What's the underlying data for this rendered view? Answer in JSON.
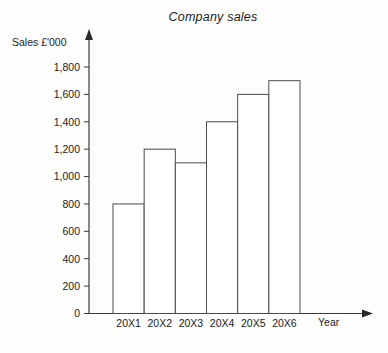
{
  "chart_data": {
    "type": "bar",
    "title": "Company sales",
    "xlabel": "Year",
    "ylabel": "Sales £'000",
    "categories": [
      "20X1",
      "20X2",
      "20X3",
      "20X4",
      "20X5",
      "20X6"
    ],
    "values": [
      800,
      1200,
      1100,
      1400,
      1600,
      1700
    ],
    "ylim": [
      0,
      1800
    ],
    "ytick_labels": [
      "1,800",
      "1,600",
      "1,400",
      "1,200",
      "1,000",
      "800",
      "600",
      "400",
      "200",
      "0"
    ],
    "ytick_values": [
      1800,
      1600,
      1400,
      1200,
      1000,
      800,
      600,
      400,
      200,
      0
    ],
    "grid": false,
    "legend": null,
    "bar_fill_color": "#ffffff",
    "bar_stroke_color": "#4a4a4a",
    "axis_color": "#3a3a3a",
    "background_color": "#fdfdfc"
  }
}
